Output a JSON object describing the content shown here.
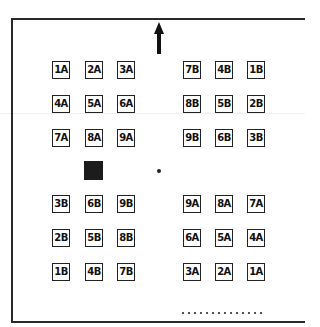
{
  "diagram": {
    "type": "seating-layout",
    "direction_arrow": "up",
    "top_left_group": {
      "rows": [
        [
          "1A",
          "2A",
          "3A"
        ],
        [
          "4A",
          "5A",
          "6A"
        ],
        [
          "7A",
          "8A",
          "9A"
        ]
      ]
    },
    "top_right_group": {
      "rows": [
        [
          "7B",
          "4B",
          "1B"
        ],
        [
          "8B",
          "5B",
          "2B"
        ],
        [
          "9B",
          "6B",
          "3B"
        ]
      ]
    },
    "bottom_left_group": {
      "rows": [
        [
          "3B",
          "6B",
          "9B"
        ],
        [
          "2B",
          "5B",
          "8B"
        ],
        [
          "1B",
          "4B",
          "7B"
        ]
      ]
    },
    "bottom_right_group": {
      "rows": [
        [
          "9A",
          "8A",
          "7A"
        ],
        [
          "6A",
          "5A",
          "4A"
        ],
        [
          "3A",
          "2A",
          "1A"
        ]
      ]
    },
    "markers": {
      "filled_square": "black square marker",
      "center_dot": "center point"
    },
    "colors": {
      "ink": "#222222",
      "background": "#ffffff"
    }
  }
}
